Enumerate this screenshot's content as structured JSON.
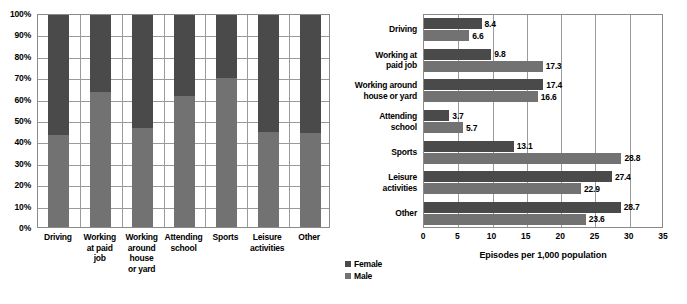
{
  "colors": {
    "female": "#4a4a4a",
    "male": "#727272",
    "grid": "#9a9a9a",
    "axis": "#8a8a8a",
    "text": "#000000",
    "background": "#ffffff"
  },
  "legend": {
    "position": "bottom-left",
    "entries": [
      {
        "label": "Female",
        "color": "#4a4a4a"
      },
      {
        "label": "Male",
        "color": "#727272"
      }
    ]
  },
  "chart_data": [
    {
      "id": "stacked-percent-by-activity",
      "type": "bar",
      "stacked": true,
      "orientation": "vertical",
      "title": "",
      "xlabel": "",
      "ylabel": "",
      "ylim": [
        0,
        100
      ],
      "ytick_labels": [
        "0%",
        "10%",
        "20%",
        "30%",
        "40%",
        "50%",
        "60%",
        "70%",
        "80%",
        "90%",
        "100%"
      ],
      "ytick_values": [
        0,
        10,
        20,
        30,
        40,
        50,
        60,
        70,
        80,
        90,
        100
      ],
      "grid": true,
      "categories": [
        "Driving",
        "Working at paid job",
        "Working around house or yard",
        "Attending school",
        "Sports",
        "Leisure activities",
        "Other"
      ],
      "category_label_lines": [
        [
          "Driving"
        ],
        [
          "Working",
          "at paid",
          "job"
        ],
        [
          "Working",
          "around",
          "house",
          "or yard"
        ],
        [
          "Attending",
          "school"
        ],
        [
          "Sports"
        ],
        [
          "Leisure",
          "activities"
        ],
        [
          "Other"
        ]
      ],
      "series": [
        {
          "name": "Male",
          "color": "#727272",
          "values": [
            43.0,
            63.0,
            46.5,
            61.0,
            69.5,
            44.5,
            44.0
          ]
        },
        {
          "name": "Female",
          "color": "#4a4a4a",
          "values": [
            57.0,
            37.0,
            53.5,
            39.0,
            30.5,
            55.5,
            56.0
          ]
        }
      ]
    },
    {
      "id": "episodes-per-1000-population",
      "type": "bar",
      "stacked": false,
      "orientation": "horizontal",
      "title": "",
      "xlabel": "Episodes per 1,000 population",
      "ylabel": "",
      "xlim": [
        0,
        35
      ],
      "xtick_values": [
        0,
        5,
        10,
        15,
        20,
        25,
        30,
        35
      ],
      "xtick_labels": [
        "0",
        "5",
        "10",
        "15",
        "20",
        "25",
        "30",
        "35"
      ],
      "grid": true,
      "categories": [
        "Driving",
        "Working at paid job",
        "Working around house or yard",
        "Attending school",
        "Sports",
        "Leisure activities",
        "Other"
      ],
      "category_label_lines": [
        [
          "Driving"
        ],
        [
          "Working at",
          "paid job"
        ],
        [
          "Working around",
          "house or yard"
        ],
        [
          "Attending",
          "school"
        ],
        [
          "Sports"
        ],
        [
          "Leisure",
          "activities"
        ],
        [
          "Other"
        ]
      ],
      "series": [
        {
          "name": "Female",
          "color": "#4a4a4a",
          "values": [
            8.4,
            9.8,
            17.4,
            3.7,
            13.1,
            27.4,
            28.7
          ]
        },
        {
          "name": "Male",
          "color": "#727272",
          "values": [
            6.6,
            17.3,
            16.6,
            5.7,
            28.8,
            22.9,
            23.6
          ]
        }
      ],
      "data_labels": {
        "Female": [
          "8.4",
          "9.8",
          "17.4",
          "3.7",
          "13.1",
          "27.4",
          "28.7"
        ],
        "Male": [
          "6.6",
          "17.3",
          "16.6",
          "5.7",
          "28.8",
          "22.9",
          "23.6"
        ]
      }
    }
  ]
}
